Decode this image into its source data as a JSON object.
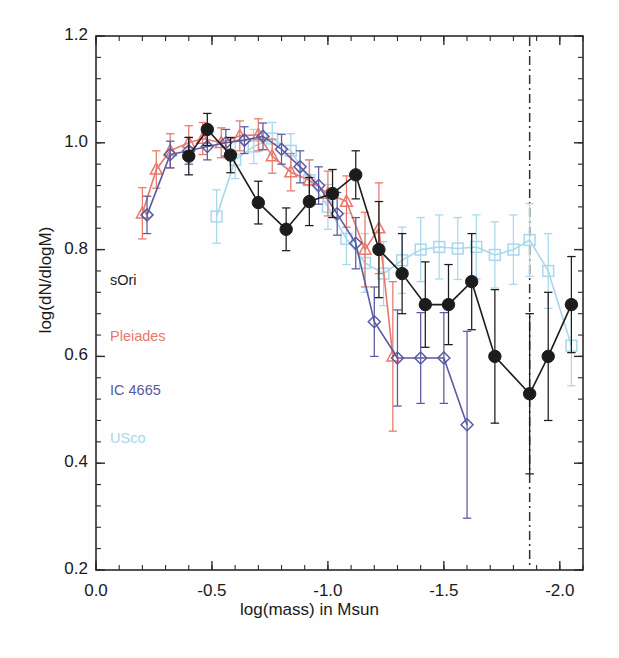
{
  "chart_data": {
    "type": "line",
    "title": "",
    "xlabel": "log(mass) in Msun",
    "ylabel": "log(dN/dlogM)",
    "xlim": [
      0.0,
      -2.1
    ],
    "ylim": [
      0.2,
      1.2
    ],
    "xticks": [
      "0.0",
      "-0.5",
      "-1.0",
      "-1.5",
      "-2.0"
    ],
    "xtick_values": [
      0.0,
      -0.5,
      -1.0,
      -1.5,
      -2.0
    ],
    "yticks": [
      "0.2",
      "0.4",
      "0.6",
      "0.8",
      "1.0",
      "1.2"
    ],
    "ytick_values": [
      0.2,
      0.4,
      0.6,
      0.8,
      1.0,
      1.2
    ],
    "grid": false,
    "legend_position": "inside-left",
    "minor_ticks_per_major": 4,
    "annotations": [
      {
        "name": "completeness-limit",
        "type": "vline",
        "x": -1.87,
        "style": "dash-dot",
        "color": "#303030"
      }
    ],
    "series": [
      {
        "name": "sOri",
        "color": "#1c1c1c",
        "marker": "filled-circle",
        "x": [
          -0.4,
          -0.48,
          -0.58,
          -0.7,
          -0.82,
          -0.92,
          -1.02,
          -1.12,
          -1.22,
          -1.32,
          -1.42,
          -1.52,
          -1.62,
          -1.72,
          -1.87,
          -1.95,
          -2.05
        ],
        "y": [
          0.975,
          1.025,
          0.977,
          0.888,
          0.838,
          0.89,
          0.905,
          0.94,
          0.8,
          0.755,
          0.697,
          0.697,
          0.74,
          0.6,
          0.53,
          0.6,
          0.697
        ],
        "yerr": [
          0.035,
          0.03,
          0.033,
          0.04,
          0.04,
          0.045,
          0.045,
          0.045,
          0.09,
          0.075,
          0.08,
          0.075,
          0.09,
          0.125,
          0.15,
          0.12,
          0.09
        ]
      },
      {
        "name": "Pleiades",
        "color": "#e8796b",
        "marker": "open-triangle",
        "x": [
          -0.2,
          -0.26,
          -0.32,
          -0.4,
          -0.46,
          -0.54,
          -0.62,
          -0.7,
          -0.76,
          -0.84,
          -0.92,
          -1.0,
          -1.08,
          -1.16,
          -1.22,
          -1.28
        ],
        "y": [
          0.868,
          0.95,
          0.985,
          1.0,
          1.008,
          1.0,
          1.013,
          1.015,
          0.975,
          0.945,
          0.93,
          0.905,
          0.89,
          0.8,
          0.84,
          0.6
        ],
        "yerr": [
          0.048,
          0.035,
          0.032,
          0.032,
          0.03,
          0.028,
          0.028,
          0.03,
          0.032,
          0.035,
          0.038,
          0.042,
          0.048,
          0.07,
          0.085,
          0.14
        ]
      },
      {
        "name": "IC 4665",
        "color": "#5a5aa0",
        "marker": "open-diamond",
        "x": [
          -0.22,
          -0.32,
          -0.4,
          -0.48,
          -0.56,
          -0.64,
          -0.72,
          -0.8,
          -0.88,
          -0.96,
          -1.04,
          -1.12,
          -1.2,
          -1.3,
          -1.4,
          -1.5,
          -1.6
        ],
        "y": [
          0.865,
          0.978,
          0.985,
          0.993,
          1.0,
          1.005,
          1.012,
          0.988,
          0.955,
          0.92,
          0.867,
          0.812,
          0.665,
          0.597,
          0.597,
          0.597,
          0.472
        ],
        "yerr": [
          0.035,
          0.025,
          0.025,
          0.025,
          0.025,
          0.025,
          0.025,
          0.028,
          0.03,
          0.035,
          0.04,
          0.048,
          0.065,
          0.09,
          0.085,
          0.085,
          0.175
        ]
      },
      {
        "name": "USco",
        "color": "#a8d8ec",
        "marker": "open-square",
        "x": [
          -0.52,
          -0.6,
          -0.68,
          -0.76,
          -0.84,
          -0.92,
          -1.0,
          -1.08,
          -1.16,
          -1.24,
          -1.32,
          -1.4,
          -1.48,
          -1.56,
          -1.64,
          -1.72,
          -1.8,
          -1.87,
          -1.95,
          -2.05
        ],
        "y": [
          0.862,
          0.968,
          0.993,
          1.008,
          0.985,
          0.93,
          0.88,
          0.82,
          0.775,
          0.755,
          0.78,
          0.8,
          0.805,
          0.802,
          0.805,
          0.79,
          0.8,
          0.818,
          0.76,
          0.62
        ],
        "yerr": [
          0.05,
          0.035,
          0.032,
          0.03,
          0.032,
          0.038,
          0.042,
          0.048,
          0.055,
          0.06,
          0.062,
          0.06,
          0.06,
          0.058,
          0.06,
          0.062,
          0.065,
          0.068,
          0.07,
          0.075
        ]
      }
    ],
    "legend": [
      {
        "label": "sOri",
        "color": "#1c1c1c"
      },
      {
        "label": "Pleiades",
        "color": "#e8796b"
      },
      {
        "label": "IC 4665",
        "color": "#5a5aa0"
      },
      {
        "label": "USco",
        "color": "#a8d8ec"
      }
    ]
  }
}
